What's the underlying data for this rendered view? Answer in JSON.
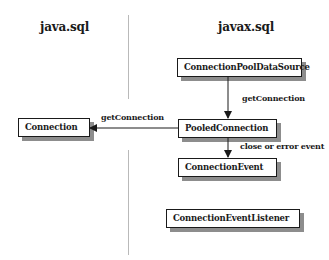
{
  "packages": {
    "left": "java.sql",
    "right": "javax.sql"
  },
  "nodes": {
    "connection_pool_data_source": "ConnectionPoolDataSource",
    "pooled_connection": "PooledConnection",
    "connection": "Connection",
    "connection_event": "ConnectionEvent",
    "connection_event_listener": "ConnectionEventListener"
  },
  "edges": {
    "cpds_to_pooled": "getConnection",
    "pooled_to_connection": "getConnection",
    "pooled_to_event": "close or error event"
  }
}
